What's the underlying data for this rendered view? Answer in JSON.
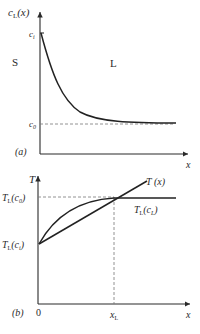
{
  "panel_a": {
    "tag": "(a)",
    "y_axis_label": "c",
    "y_axis_sub": "L",
    "y_axis_arg": "(x)",
    "x_axis_label": "x",
    "tick_top": "c",
    "tick_top_sub": "i",
    "tick_bottom": "c",
    "tick_bottom_sub": "0",
    "region_left": "S",
    "region_right": "L",
    "curve": "exponential decay of liquid concentration from c_i at interface to c_0 far field"
  },
  "panel_b": {
    "tag": "(b)",
    "y_axis_label": "T",
    "x_axis_label": "x",
    "origin_label": "0",
    "x_tick": "x",
    "x_tick_sub": "L",
    "level_top": "T",
    "level_top_sub": "L",
    "level_top_arg": "(c",
    "level_top_arg_sub": "0",
    "level_top_close": ")",
    "level_bottom": "T",
    "level_bottom_sub": "L",
    "level_bottom_arg": "(c",
    "level_bottom_arg_sub": "i",
    "level_bottom_close": ")",
    "line_label": "T (x)",
    "curve_label": "T",
    "curve_label_sub": "L",
    "curve_label_arg": "(c",
    "curve_label_arg_sub": "L",
    "curve_label_close": ")"
  }
}
